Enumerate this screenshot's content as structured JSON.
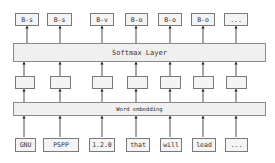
{
  "diagram": {
    "outputs": [
      "B-s",
      "B-s",
      "B-v",
      "B-o",
      "B-o",
      "B-o",
      "..."
    ],
    "softmax_label": "Softmax Layer",
    "embedding_label": "Word embedding",
    "inputs": [
      "GNU",
      "PSPP",
      "1.2.0",
      "that",
      "will",
      "lead",
      "..."
    ],
    "colors": {
      "border": "#7a7a7a",
      "fill": "#f4f4f4",
      "arrow": "#222222"
    }
  }
}
